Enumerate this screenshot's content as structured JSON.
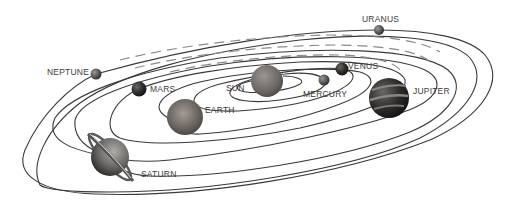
{
  "diagram": {
    "labels": {
      "neptune": "NEPTUNE",
      "uranus": "URANUS",
      "mars": "MARS",
      "sun": "SUN",
      "venus": "VENUS",
      "mercury": "MERCURY",
      "earth": "EARTH",
      "jupiter": "JUPITER",
      "saturn": "SATURN"
    },
    "bodies": [
      {
        "name": "Sun",
        "cx": 267,
        "cy": 81,
        "r": 16,
        "color": "#6e6a66"
      },
      {
        "name": "Mercury",
        "cx": 324,
        "cy": 80,
        "r": 5.5,
        "color": "#4a4846"
      },
      {
        "name": "Venus",
        "cx": 342,
        "cy": 69,
        "r": 6.5,
        "color": "#3e3c3a"
      },
      {
        "name": "Earth",
        "cx": 185,
        "cy": 117,
        "r": 18,
        "color": "#5a5552"
      },
      {
        "name": "Mars",
        "cx": 139,
        "cy": 89,
        "r": 7.5,
        "color": "#222222"
      },
      {
        "name": "Jupiter",
        "cx": 389,
        "cy": 98,
        "r": 20,
        "color": "#2e2c2a"
      },
      {
        "name": "Saturn",
        "cx": 110,
        "cy": 157,
        "r": 19,
        "color": "#4a4846"
      },
      {
        "name": "Uranus",
        "cx": 379,
        "cy": 30,
        "r": 5,
        "color": "#555250"
      },
      {
        "name": "Neptune",
        "cx": 96,
        "cy": 74,
        "r": 5.5,
        "color": "#5a5856"
      }
    ],
    "colors": {
      "orbit": "#3a3a3a",
      "label": "#3c3c3c",
      "background": "#ffffff"
    }
  }
}
